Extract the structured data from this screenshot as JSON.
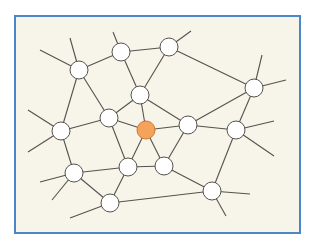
{
  "diagram": {
    "type": "network-graph",
    "frame": {
      "x": 15,
      "y": 16,
      "width": 285,
      "height": 217,
      "fill": "#f7f4ea",
      "border": "#4a86c8"
    },
    "colors": {
      "edge": "#55524c",
      "node_fill": "#ffffff",
      "node_stroke": "#55524c",
      "highlight_fill": "#f5a35a",
      "highlight_stroke": "#c97a35"
    },
    "node_radius": 9,
    "nodes": [
      {
        "id": "A",
        "x": 79,
        "y": 70,
        "highlight": false
      },
      {
        "id": "B",
        "x": 121,
        "y": 52,
        "highlight": false
      },
      {
        "id": "D",
        "x": 169,
        "y": 47,
        "highlight": false
      },
      {
        "id": "E",
        "x": 254,
        "y": 88,
        "highlight": false
      },
      {
        "id": "C",
        "x": 140,
        "y": 95,
        "highlight": false
      },
      {
        "id": "G",
        "x": 109,
        "y": 118,
        "highlight": false
      },
      {
        "id": "O",
        "x": 146,
        "y": 130,
        "highlight": true
      },
      {
        "id": "K",
        "x": 188,
        "y": 125,
        "highlight": false
      },
      {
        "id": "L",
        "x": 236,
        "y": 130,
        "highlight": false
      },
      {
        "id": "F",
        "x": 61,
        "y": 131,
        "highlight": false
      },
      {
        "id": "I",
        "x": 128,
        "y": 167,
        "highlight": false
      },
      {
        "id": "M",
        "x": 164,
        "y": 166,
        "highlight": false
      },
      {
        "id": "H",
        "x": 74,
        "y": 173,
        "highlight": false
      },
      {
        "id": "N",
        "x": 212,
        "y": 191,
        "highlight": false
      },
      {
        "id": "J",
        "x": 110,
        "y": 203,
        "highlight": false
      }
    ],
    "edges": [
      [
        "A",
        "B"
      ],
      [
        "B",
        "D"
      ],
      [
        "D",
        "E"
      ],
      [
        "A",
        "F"
      ],
      [
        "A",
        "G"
      ],
      [
        "B",
        "C"
      ],
      [
        "D",
        "C"
      ],
      [
        "C",
        "G"
      ],
      [
        "C",
        "O"
      ],
      [
        "C",
        "K"
      ],
      [
        "E",
        "K"
      ],
      [
        "E",
        "L"
      ],
      [
        "G",
        "F"
      ],
      [
        "G",
        "O"
      ],
      [
        "G",
        "I"
      ],
      [
        "O",
        "K"
      ],
      [
        "O",
        "I"
      ],
      [
        "O",
        "M"
      ],
      [
        "K",
        "L"
      ],
      [
        "K",
        "M"
      ],
      [
        "I",
        "M"
      ],
      [
        "F",
        "H"
      ],
      [
        "H",
        "I"
      ],
      [
        "H",
        "J"
      ],
      [
        "I",
        "J"
      ],
      [
        "J",
        "N"
      ],
      [
        "M",
        "N"
      ],
      [
        "L",
        "N"
      ]
    ],
    "stubs": [
      {
        "from": "A",
        "x": 40,
        "y": 50
      },
      {
        "from": "A",
        "x": 70,
        "y": 38
      },
      {
        "from": "B",
        "x": 113,
        "y": 32
      },
      {
        "from": "D",
        "x": 191,
        "y": 31
      },
      {
        "from": "E",
        "x": 262,
        "y": 55
      },
      {
        "from": "E",
        "x": 286,
        "y": 80
      },
      {
        "from": "F",
        "x": 28,
        "y": 110
      },
      {
        "from": "F",
        "x": 28,
        "y": 152
      },
      {
        "from": "L",
        "x": 274,
        "y": 121
      },
      {
        "from": "L",
        "x": 274,
        "y": 156
      },
      {
        "from": "H",
        "x": 40,
        "y": 182
      },
      {
        "from": "H",
        "x": 52,
        "y": 200
      },
      {
        "from": "J",
        "x": 70,
        "y": 218
      },
      {
        "from": "N",
        "x": 250,
        "y": 194
      },
      {
        "from": "N",
        "x": 226,
        "y": 216
      }
    ]
  }
}
